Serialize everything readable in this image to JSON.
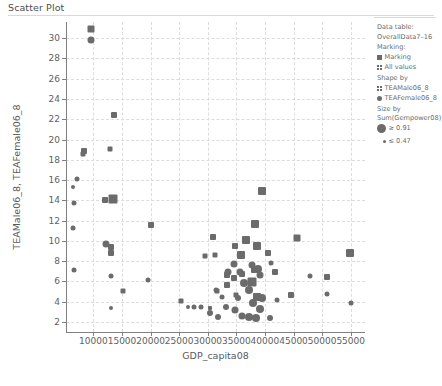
{
  "chart_title": "Scatter Plot",
  "legend": {
    "data_table_label": "Data table:",
    "data_table_value": "OverallData7–16",
    "marking_label": "Marking:",
    "marking_items": [
      {
        "label": "Marking",
        "icon": "filled-square-swatch"
      },
      {
        "label": "All values",
        "icon": "grid-square-swatch"
      }
    ],
    "shape_by_label": "Shape by",
    "shape_items": [
      {
        "label": "TEAMale06_8",
        "icon": "grid-square-swatch"
      },
      {
        "label": "TEAFemale06_8",
        "icon": "circle-swatch"
      }
    ],
    "size_by_label": "Size by",
    "size_by_value": "Sum(Gempower08)",
    "size_items": [
      {
        "label": "≥ 0.91",
        "icon": "large-circle-swatch"
      },
      {
        "label": "≤ 0.47",
        "icon": "small-circle-swatch"
      }
    ]
  },
  "colors": {
    "marker": "#6b6b6b",
    "grid": "#dcdcdc",
    "axis": "#808080",
    "text": "#595959",
    "background": "#ffffff"
  },
  "chart_data": {
    "type": "scatter",
    "title": "Scatter Plot",
    "xlabel": "GDP_capita08",
    "ylabel": "TEAMale06_8, TEAFemale06_8",
    "xlim": [
      5200,
      57500
    ],
    "ylim": [
      1.0,
      31.6
    ],
    "xticks": [
      10000,
      15000,
      20000,
      25000,
      30000,
      35000,
      40000,
      45000,
      50000,
      55000
    ],
    "yticks": [
      2,
      4,
      6,
      8,
      10,
      12,
      14,
      16,
      18,
      20,
      22,
      24,
      26,
      28,
      30
    ],
    "grid": true,
    "legend_position": "right",
    "series": [
      {
        "name": "TEAMale06_8",
        "marker": "square",
        "points": [
          {
            "x": 9600,
            "y": 30.9,
            "size": 7
          },
          {
            "x": 13600,
            "y": 22.4,
            "size": 6
          },
          {
            "x": 12900,
            "y": 19.1,
            "size": 5
          },
          {
            "x": 8300,
            "y": 18.9,
            "size": 6
          },
          {
            "x": 8200,
            "y": 18.6,
            "size": 5
          },
          {
            "x": 13400,
            "y": 14.1,
            "size": 9
          },
          {
            "x": 12000,
            "y": 14.0,
            "size": 6
          },
          {
            "x": 13100,
            "y": 9.4,
            "size": 6
          },
          {
            "x": 13100,
            "y": 8.8,
            "size": 6
          },
          {
            "x": 20100,
            "y": 11.6,
            "size": 6
          },
          {
            "x": 30900,
            "y": 10.4,
            "size": 6
          },
          {
            "x": 45600,
            "y": 10.3,
            "size": 7
          },
          {
            "x": 39400,
            "y": 14.9,
            "size": 8
          },
          {
            "x": 38200,
            "y": 11.7,
            "size": 8
          },
          {
            "x": 34800,
            "y": 9.5,
            "size": 6
          },
          {
            "x": 36600,
            "y": 10.1,
            "size": 8
          },
          {
            "x": 38600,
            "y": 9.5,
            "size": 8
          },
          {
            "x": 40600,
            "y": 8.8,
            "size": 6
          },
          {
            "x": 29600,
            "y": 8.5,
            "size": 5
          },
          {
            "x": 31300,
            "y": 8.6,
            "size": 5
          },
          {
            "x": 35800,
            "y": 8.6,
            "size": 8
          },
          {
            "x": 54900,
            "y": 8.8,
            "size": 8
          },
          {
            "x": 36000,
            "y": 6.7,
            "size": 6
          },
          {
            "x": 33300,
            "y": 6.6,
            "size": 6
          },
          {
            "x": 34600,
            "y": 6.3,
            "size": 6
          },
          {
            "x": 33400,
            "y": 5.6,
            "size": 6
          },
          {
            "x": 37700,
            "y": 5.9,
            "size": 9
          },
          {
            "x": 38600,
            "y": 4.5,
            "size": 8
          },
          {
            "x": 35000,
            "y": 4.7,
            "size": 5
          },
          {
            "x": 31600,
            "y": 5.0,
            "size": 5
          },
          {
            "x": 50800,
            "y": 6.4,
            "size": 6
          },
          {
            "x": 44600,
            "y": 4.7,
            "size": 6
          },
          {
            "x": 25300,
            "y": 4.1,
            "size": 5
          },
          {
            "x": 15100,
            "y": 5.0,
            "size": 5
          },
          {
            "x": 41700,
            "y": 6.9,
            "size": 6
          },
          {
            "x": 38000,
            "y": 7.1,
            "size": 6
          },
          {
            "x": 30400,
            "y": 3.4,
            "size": 4
          }
        ]
      },
      {
        "name": "TEAFemale06_8",
        "marker": "circle",
        "points": [
          {
            "x": 9600,
            "y": 29.8,
            "size": 7
          },
          {
            "x": 7200,
            "y": 16.1,
            "size": 5
          },
          {
            "x": 6600,
            "y": 13.7,
            "size": 5
          },
          {
            "x": 6400,
            "y": 15.3,
            "size": 4
          },
          {
            "x": 6500,
            "y": 11.3,
            "size": 5
          },
          {
            "x": 12200,
            "y": 9.7,
            "size": 7
          },
          {
            "x": 6600,
            "y": 7.1,
            "size": 5
          },
          {
            "x": 13100,
            "y": 6.5,
            "size": 5
          },
          {
            "x": 19600,
            "y": 6.1,
            "size": 5
          },
          {
            "x": 13000,
            "y": 3.4,
            "size": 4
          },
          {
            "x": 31400,
            "y": 5.1,
            "size": 5
          },
          {
            "x": 34600,
            "y": 7.7,
            "size": 7
          },
          {
            "x": 37700,
            "y": 7.6,
            "size": 7
          },
          {
            "x": 38800,
            "y": 7.2,
            "size": 8
          },
          {
            "x": 39200,
            "y": 6.6,
            "size": 7
          },
          {
            "x": 35700,
            "y": 6.9,
            "size": 7
          },
          {
            "x": 33600,
            "y": 6.9,
            "size": 7
          },
          {
            "x": 36300,
            "y": 5.8,
            "size": 8
          },
          {
            "x": 37200,
            "y": 5.1,
            "size": 8
          },
          {
            "x": 39400,
            "y": 4.4,
            "size": 8
          },
          {
            "x": 37900,
            "y": 3.9,
            "size": 8
          },
          {
            "x": 39100,
            "y": 3.3,
            "size": 8
          },
          {
            "x": 37200,
            "y": 2.5,
            "size": 8
          },
          {
            "x": 38500,
            "y": 2.4,
            "size": 8
          },
          {
            "x": 36000,
            "y": 2.6,
            "size": 7
          },
          {
            "x": 34700,
            "y": 3.2,
            "size": 7
          },
          {
            "x": 33100,
            "y": 3.5,
            "size": 6
          },
          {
            "x": 30400,
            "y": 2.9,
            "size": 6
          },
          {
            "x": 31800,
            "y": 2.5,
            "size": 6
          },
          {
            "x": 28800,
            "y": 3.5,
            "size": 5
          },
          {
            "x": 27600,
            "y": 3.5,
            "size": 5
          },
          {
            "x": 26500,
            "y": 3.5,
            "size": 4
          },
          {
            "x": 42100,
            "y": 4.2,
            "size": 5
          },
          {
            "x": 47900,
            "y": 6.5,
            "size": 5
          },
          {
            "x": 55000,
            "y": 3.9,
            "size": 5
          },
          {
            "x": 50800,
            "y": 4.8,
            "size": 5
          },
          {
            "x": 40800,
            "y": 2.4,
            "size": 6
          },
          {
            "x": 35300,
            "y": 4.4,
            "size": 6
          },
          {
            "x": 32400,
            "y": 4.5,
            "size": 5
          },
          {
            "x": 41000,
            "y": 7.8,
            "size": 5
          }
        ]
      }
    ]
  }
}
